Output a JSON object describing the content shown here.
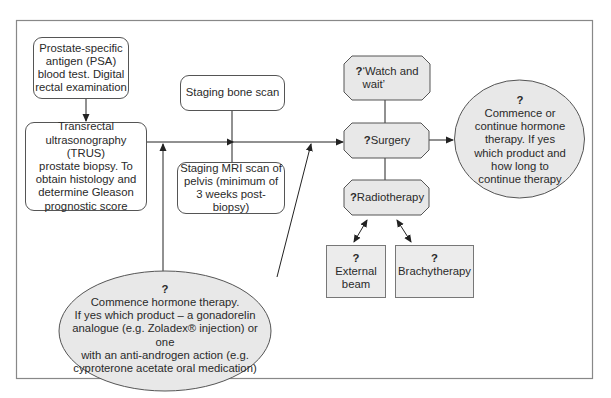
{
  "diagram": {
    "type": "flowchart",
    "nodes": {
      "psa": {
        "text": "Prostate-specific antigen (PSA) blood test. Digital rectal examination",
        "lines": [
          "Prostate-specific",
          "antigen (PSA)",
          "blood test. Digital",
          "rectal examination"
        ]
      },
      "trus": {
        "lines": [
          "Transrectal",
          "ultrasonography (TRUS)",
          "prostate biopsy. To",
          "obtain histology and",
          "determine Gleason",
          "prognostic score"
        ]
      },
      "bone_scan": {
        "lines": [
          "Staging bone scan"
        ]
      },
      "mri": {
        "lines": [
          "Staging MRI scan of",
          "pelvis (minimum of",
          "3 weeks post-biopsy)"
        ]
      },
      "watch_wait": {
        "q": "?",
        "lines": [
          "‘Watch and",
          "wait’"
        ]
      },
      "surgery": {
        "q": "?",
        "label": "Surgery"
      },
      "radiotherapy": {
        "q": "?",
        "label": "Radiotherapy"
      },
      "external_beam": {
        "q": "?",
        "lines": [
          "External",
          "beam"
        ]
      },
      "brachytherapy": {
        "q": "?",
        "label": "Brachytherapy"
      },
      "continue_hormone": {
        "q": "?",
        "lines": [
          "Commence or",
          "continue hormone",
          "therapy. If yes",
          "which product and",
          "how long to",
          "continue therapy"
        ]
      },
      "commence_hormone": {
        "q": "?",
        "lines": [
          "Commence hormone therapy.",
          "If yes which product – a gonadorelin",
          "analogue (e.g. Zoladex® injection) or one",
          "with an anti-androgen action (e.g.",
          "cyproterone acetate oral medication)"
        ]
      }
    },
    "colors": {
      "line": "#222222",
      "frame": "#888888",
      "decision_fill": "#e8e8e8",
      "box_fill": "#ffffff"
    }
  }
}
